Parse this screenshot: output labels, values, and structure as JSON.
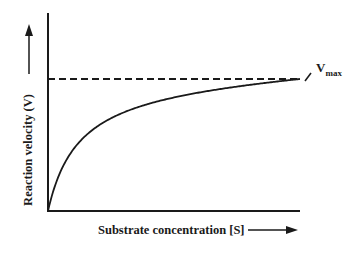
{
  "chart_data": {
    "type": "line",
    "title": "",
    "xlabel": "Substrate concentration [S]",
    "ylabel": "Reaction velocity (V)",
    "xlim": [
      0,
      10
    ],
    "ylim": [
      0,
      1.5
    ],
    "grid": false,
    "series": [
      {
        "name": "Michaelis-Menten curve",
        "style": "solid",
        "function": "V = Vmax*S/(Km+S)",
        "Vmax": 1.0,
        "Km": 1.2,
        "x": [
          0,
          0.25,
          0.5,
          1,
          1.5,
          2,
          3,
          4,
          5,
          6,
          7,
          8,
          10
        ],
        "y": [
          0,
          0.17,
          0.29,
          0.45,
          0.56,
          0.63,
          0.71,
          0.77,
          0.81,
          0.83,
          0.85,
          0.87,
          0.89
        ]
      },
      {
        "name": "Vmax asymptote",
        "style": "dashed",
        "x": [
          0,
          10
        ],
        "y": [
          1.0,
          1.0
        ]
      }
    ],
    "annotations": [
      {
        "text": "V",
        "subscript": "max",
        "target": "Vmax asymptote"
      }
    ],
    "axis_arrows": {
      "x": "right",
      "y": "up"
    }
  }
}
